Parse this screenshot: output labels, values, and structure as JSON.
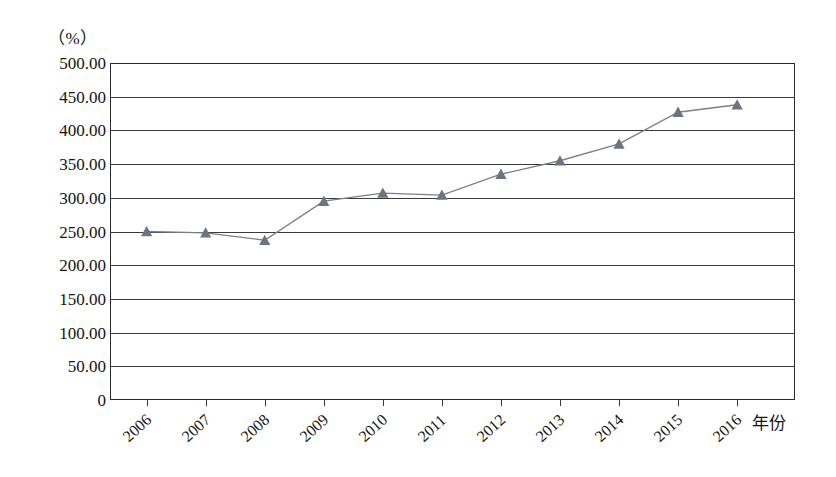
{
  "chart_data": {
    "type": "line",
    "title": "",
    "xlabel": "年份",
    "ylabel": "（%）",
    "unit_label": "（%）",
    "categories": [
      "2006",
      "2007",
      "2008",
      "2009",
      "2010",
      "2011",
      "2012",
      "2013",
      "2014",
      "2015",
      "2016"
    ],
    "values": [
      250.0,
      248.0,
      237.0,
      295.0,
      307.0,
      304.0,
      335.0,
      355.0,
      380.0,
      427.0,
      438.0
    ],
    "series": [
      {
        "name": "",
        "values": [
          250.0,
          248.0,
          237.0,
          295.0,
          307.0,
          304.0,
          335.0,
          355.0,
          380.0,
          427.0,
          438.0
        ]
      }
    ],
    "ylim": [
      0,
      500
    ],
    "ytick_values": [
      500,
      450,
      400,
      350,
      300,
      250,
      200,
      150,
      100,
      50,
      0
    ],
    "ytick_labels": [
      "500.00",
      "450.00",
      "400.00",
      "350.00",
      "300.00",
      "250.00",
      "200.00",
      "150.00",
      "100.00",
      "50.00",
      "0"
    ],
    "grid": true,
    "grid_axis": "y",
    "legend": "none",
    "marker": "triangle",
    "marker_color": "#6e7381",
    "line_color": "#7b808c",
    "axis_color": "#2b2b2b",
    "background": "#ffffff"
  }
}
